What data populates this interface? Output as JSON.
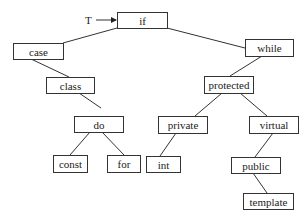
{
  "diagram": {
    "type": "binary-search-tree",
    "root_pointer_label": "T",
    "nodes": [
      {
        "id": "if",
        "label": "if",
        "x": 117,
        "y": 12,
        "w": 50,
        "h": 16
      },
      {
        "id": "case",
        "label": "case",
        "x": 13,
        "y": 43,
        "w": 50,
        "h": 16
      },
      {
        "id": "while",
        "label": "while",
        "x": 245,
        "y": 39,
        "w": 48,
        "h": 17
      },
      {
        "id": "class",
        "label": "class",
        "x": 46,
        "y": 77,
        "w": 48,
        "h": 16
      },
      {
        "id": "protected",
        "label": "protected",
        "x": 204,
        "y": 76,
        "w": 49,
        "h": 17
      },
      {
        "id": "do",
        "label": "do",
        "x": 74,
        "y": 116,
        "w": 49,
        "h": 16
      },
      {
        "id": "private",
        "label": "private",
        "x": 158,
        "y": 116,
        "w": 49,
        "h": 17
      },
      {
        "id": "virtual",
        "label": "virtual",
        "x": 249,
        "y": 116,
        "w": 49,
        "h": 17
      },
      {
        "id": "const",
        "label": "const",
        "x": 53,
        "y": 155,
        "w": 34,
        "h": 17
      },
      {
        "id": "for",
        "label": "for",
        "x": 107,
        "y": 155,
        "w": 33,
        "h": 17
      },
      {
        "id": "int",
        "label": "int",
        "x": 146,
        "y": 156,
        "w": 34,
        "h": 16
      },
      {
        "id": "public",
        "label": "public",
        "x": 231,
        "y": 157,
        "w": 49,
        "h": 16
      },
      {
        "id": "template",
        "label": "template",
        "x": 243,
        "y": 193,
        "w": 50,
        "h": 16
      }
    ],
    "edges": [
      {
        "from": "if",
        "to": "case",
        "x1": 117,
        "y1": 28,
        "x2": 63,
        "y2": 43
      },
      {
        "from": "if",
        "to": "while",
        "x1": 167,
        "y1": 28,
        "x2": 245,
        "y2": 48
      },
      {
        "from": "case",
        "to": "class",
        "x1": 31,
        "y1": 59,
        "x2": 69,
        "y2": 77
      },
      {
        "from": "class",
        "to": "do",
        "x1": 79,
        "y1": 93,
        "x2": 101,
        "y2": 108
      },
      {
        "from": "while",
        "to": "protected",
        "x1": 262,
        "y1": 56,
        "x2": 230,
        "y2": 76
      },
      {
        "from": "protected",
        "to": "private",
        "x1": 222,
        "y1": 93,
        "x2": 195,
        "y2": 116
      },
      {
        "from": "protected",
        "to": "virtual",
        "x1": 240,
        "y1": 93,
        "x2": 267,
        "y2": 116
      },
      {
        "from": "do",
        "to": "const",
        "x1": 90,
        "y1": 132,
        "x2": 70,
        "y2": 155
      },
      {
        "from": "do",
        "to": "for",
        "x1": 102,
        "y1": 132,
        "x2": 124,
        "y2": 155
      },
      {
        "from": "private",
        "to": "int",
        "x1": 176,
        "y1": 133,
        "x2": 160,
        "y2": 156
      },
      {
        "from": "virtual",
        "to": "public",
        "x1": 273,
        "y1": 133,
        "x2": 255,
        "y2": 157
      },
      {
        "from": "public",
        "to": "template",
        "x1": 253,
        "y1": 173,
        "x2": 267,
        "y2": 193
      }
    ],
    "root_arrow": {
      "label_x": 89,
      "label_y": 20,
      "x1": 96,
      "y1": 20,
      "x2": 117,
      "y2": 20
    }
  }
}
